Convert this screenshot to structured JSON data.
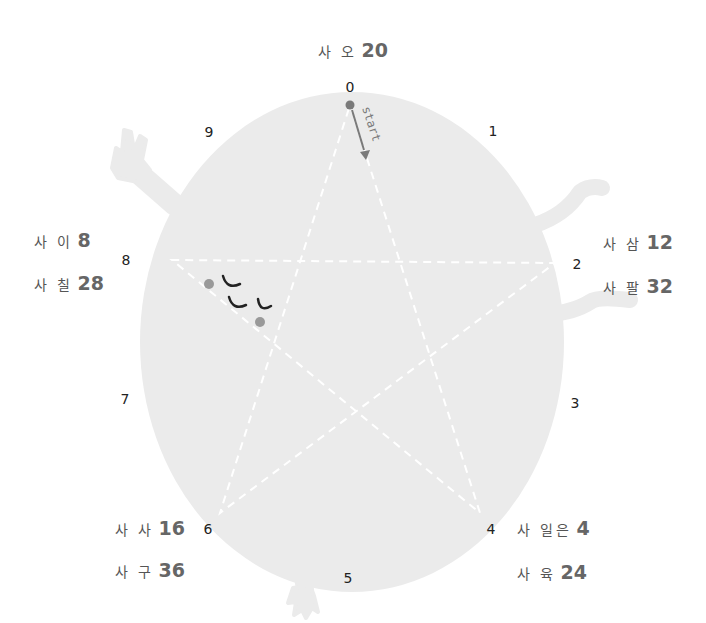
{
  "colors": {
    "blob": "#ebebeb",
    "star_lines": "#ffffff",
    "arrow": "#7a7a7a",
    "dot": "#999999",
    "eye_arc": "#222222",
    "numbers": "#222222",
    "labels": "#555555"
  },
  "start_label": "start",
  "numbers": [
    "0",
    "1",
    "2",
    "3",
    "4",
    "5",
    "6",
    "7",
    "8",
    "9"
  ],
  "labels": [
    {
      "id": "top",
      "kr": "사 오",
      "value": "20"
    },
    {
      "id": "left-1",
      "kr": "사 이",
      "value": "8"
    },
    {
      "id": "left-2",
      "kr": "사 칠",
      "value": "28"
    },
    {
      "id": "right-1",
      "kr": "사 삼",
      "value": "12"
    },
    {
      "id": "right-2",
      "kr": "사 팔",
      "value": "32"
    },
    {
      "id": "bottom-left-1",
      "kr": "사 사",
      "value": "16"
    },
    {
      "id": "bottom-left-2",
      "kr": "사 구",
      "value": "36"
    },
    {
      "id": "bottom-right-1",
      "kr": "사 일은",
      "value": "4"
    },
    {
      "id": "bottom-right-2",
      "kr": "사 육",
      "value": "24"
    }
  ]
}
